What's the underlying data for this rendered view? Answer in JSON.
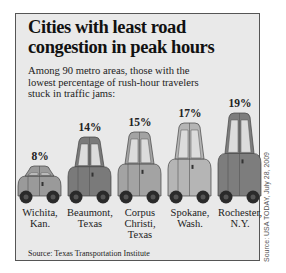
{
  "title": "Cities with least road congestion in peak hours",
  "title_lines": [
    "Cities with least road",
    "congestion in peak hours"
  ],
  "subtitle_lines": [
    "Among 90 metro areas, those with the",
    "lowest percentage of rush-hour travelers",
    "stuck in traffic jams:"
  ],
  "source": "Source: Texas Transportation Institute",
  "credit": "Source: USA TODAY, July 28, 2009",
  "colors": {
    "background": "#e9e9e9",
    "car_1": "#9a9a9a",
    "car_2": "#7a7a7a",
    "car_3": "#a3a3a3",
    "car_4": "#b5b5b5",
    "car_5": "#7d7d7d",
    "window": "#dcdcdc",
    "wheel": "#2a2a2a"
  },
  "bars": [
    {
      "label": "8%",
      "city_lines": [
        "Wichita,",
        "Kan."
      ]
    },
    {
      "label": "14%",
      "city_lines": [
        "Beaumont,",
        "Texas"
      ]
    },
    {
      "label": "15%",
      "city_lines": [
        "Corpus",
        "Christi,",
        "Texas"
      ]
    },
    {
      "label": "17%",
      "city_lines": [
        "Spokane,",
        "Wash."
      ]
    },
    {
      "label": "19%",
      "city_lines": [
        "Rochester,",
        "N.Y."
      ]
    }
  ],
  "chart_data": {
    "type": "bar",
    "title": "Cities with least road congestion in peak hours",
    "subtitle": "Among 90 metro areas, those with the lowest percentage of rush-hour travelers stuck in traffic jams:",
    "categories": [
      "Wichita, Kan.",
      "Beaumont, Texas",
      "Corpus Christi, Texas",
      "Spokane, Wash.",
      "Rochester, N.Y."
    ],
    "values": [
      8,
      14,
      15,
      17,
      19
    ],
    "unit": "%",
    "xlabel": "",
    "ylabel": "",
    "grid": false,
    "legend": null,
    "source": "Texas Transportation Institute",
    "note": "Bars drawn as cars; height proportional to percentage"
  }
}
